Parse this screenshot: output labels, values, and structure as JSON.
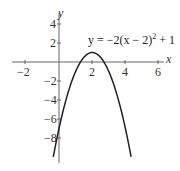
{
  "chart_data": {
    "type": "line",
    "title": "",
    "xlabel": "x",
    "ylabel": "y",
    "xlim": [
      -2.8,
      6.3
    ],
    "ylim": [
      -10.6,
      5.2
    ],
    "grid": false,
    "legend": null,
    "x_ticks": [
      -2,
      2,
      4,
      6
    ],
    "x_tick_labels": [
      "−2",
      "2",
      "4",
      "6"
    ],
    "y_ticks": [
      4,
      2,
      -2,
      -4,
      -6,
      -8
    ],
    "y_tick_labels": [
      "4",
      "2",
      "−2",
      "−4",
      "−6",
      "−8"
    ],
    "annotations": [
      {
        "text": "y = −2(x − 2)² + 1",
        "x": 3.9,
        "y": 3.2
      }
    ],
    "series": [
      {
        "name": "y = -2(x-2)^2 + 1",
        "function": "-2*(x-2)^2+1",
        "domain": [
          -0.345,
          4.345
        ],
        "vertex": [
          2,
          1
        ],
        "x_intercepts": [
          1.293,
          2.707
        ],
        "y_intercept": -7,
        "x": [
          -0.345,
          0,
          0.5,
          1,
          1.5,
          2,
          2.5,
          3,
          3.5,
          4,
          4.345
        ],
        "y": [
          -10,
          -7,
          -3.5,
          -1,
          0.5,
          1,
          0.5,
          -1,
          -3.5,
          -7,
          -10
        ]
      }
    ]
  },
  "labels": {
    "x_axis": "x",
    "y_axis": "y",
    "equation_prefix": "y = −2(x − 2)",
    "equation_exp": "2",
    "equation_suffix": " + 1",
    "x_ticks": [
      "−2",
      "2",
      "4",
      "6"
    ],
    "y_ticks": [
      "4",
      "2",
      "−2",
      "−4",
      "−6",
      "−8"
    ]
  }
}
